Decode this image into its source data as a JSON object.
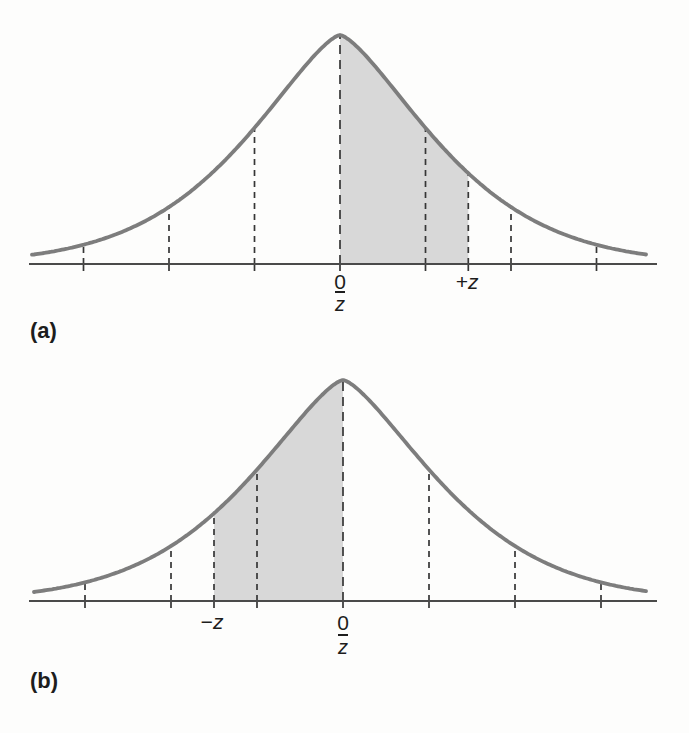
{
  "style": {
    "background": "#fdfdfc",
    "curve_color": "#7d7d7d",
    "shade_color": "#d8d8d8",
    "dash_color": "#363636",
    "baseline_color": "#4a4a4a",
    "text_color": "#1d1d1d"
  },
  "chart_data": [
    {
      "id": "a",
      "type": "area",
      "curve": "normal-distribution-density",
      "panel_label": "(a)",
      "x_unit": "z-score (standard deviations from mean)",
      "x_range": [
        -3.6,
        3.6
      ],
      "grid": false,
      "dashed_lines_x": [
        -3,
        -2,
        -1,
        0,
        1,
        1.5,
        2,
        3
      ],
      "shaded_interval": [
        0,
        1.5
      ],
      "tick_labels": [
        {
          "x": 0,
          "text": "0"
        },
        {
          "x": 1.5,
          "text": "+z"
        }
      ],
      "axis_sub_label": {
        "x": 0,
        "text": "z",
        "overline": true
      },
      "layout": {
        "cx": 340,
        "sigma_px": 85.5,
        "baseline_y": 264,
        "peak_y": 35,
        "curve_x0": 32,
        "curve_x1": 646,
        "axis_x0": 29,
        "axis_x1": 657
      }
    },
    {
      "id": "b",
      "type": "area",
      "curve": "normal-distribution-density",
      "panel_label": "(b)",
      "x_unit": "z-score (standard deviations from mean)",
      "x_range": [
        -3.6,
        3.6
      ],
      "grid": false,
      "dashed_lines_x": [
        -3,
        -2,
        -1.5,
        -1,
        0,
        1,
        2,
        3
      ],
      "shaded_interval": [
        -1.5,
        0
      ],
      "tick_labels": [
        {
          "x": -1.5,
          "text": "−z"
        },
        {
          "x": 0,
          "text": "0"
        }
      ],
      "axis_sub_label": {
        "x": 0,
        "text": "z",
        "overline": true
      },
      "layout": {
        "cx": 343,
        "sigma_px": 86,
        "baseline_y": 601,
        "peak_y": 380,
        "curve_x0": 34,
        "curve_x1": 646,
        "axis_x0": 29,
        "axis_x1": 657
      }
    }
  ]
}
